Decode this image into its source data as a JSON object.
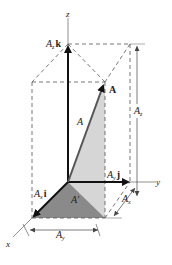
{
  "diagram": {
    "axes": {
      "x": "x",
      "y": "y",
      "z": "z"
    },
    "vector": {
      "name": "A",
      "magnitude_label": "A"
    },
    "components": {
      "x": {
        "vector_label": "A",
        "sub": "x",
        "unit": "i"
      },
      "y": {
        "vector_label": "A",
        "sub": "y",
        "unit": "j"
      },
      "z": {
        "vector_label": "A",
        "sub": "z",
        "unit": "k"
      }
    },
    "projection_label": "A′",
    "dimensions": {
      "ax": {
        "label": "A",
        "sub": "x"
      },
      "ay": {
        "label": "A",
        "sub": "y"
      },
      "az": {
        "label": "A",
        "sub": "z"
      }
    },
    "colors": {
      "dark_triangle": "#8a8a8a",
      "light_triangle": "#d6d6d6",
      "lines": "#333333",
      "dashed": "#555555"
    }
  }
}
